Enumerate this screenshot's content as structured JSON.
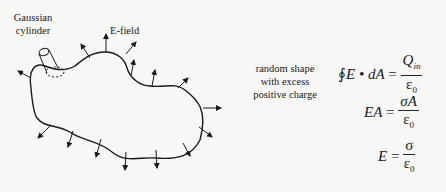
{
  "labels": {
    "gaussian_cylinder": "Gaussian cylinder",
    "e_field": "E-field",
    "random_shape": "random shape with excess positive charge"
  },
  "equations": [
    {
      "lhs_prefix": "∮",
      "lhs": "E • dA",
      "eq": "=",
      "num": "Q",
      "num_sub": "in",
      "den": "ε",
      "den_sub": "0"
    },
    {
      "lhs": "EA",
      "eq": "=",
      "num": "σA",
      "den": "ε",
      "den_sub": "0"
    },
    {
      "lhs": "E",
      "eq": "=",
      "num": "σ",
      "den": "ε",
      "den_sub": "0"
    }
  ],
  "colors": {
    "ink": "#1a1a1a",
    "background": "#f7f7f5"
  }
}
